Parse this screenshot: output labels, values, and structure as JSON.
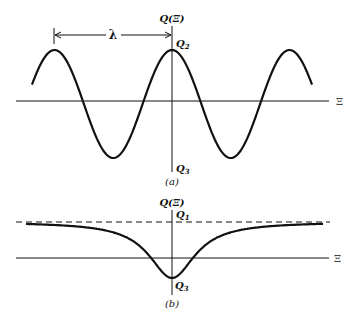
{
  "panel_a": {
    "caption": "(a)",
    "y_axis_label": "Q(Ξ)",
    "x_axis_label": "Ξ",
    "wavelength_label": "λ",
    "max_label": "Q",
    "max_sub": "2",
    "min_label": "Q",
    "min_sub": "3",
    "curve": "sinusoid, peaks at -λ, 0, +λ; amplitude between Q3 and Q2"
  },
  "panel_b": {
    "caption": "(b)",
    "y_axis_label": "Q(Ξ)",
    "x_axis_label": "Ξ",
    "asymptote_label": "Q",
    "asymptote_sub": "1",
    "min_label": "Q",
    "min_sub": "3",
    "curve": "single dip to Q3 at Ξ=0, approaching asymptote Q1 (dashed) as |Ξ| grows"
  },
  "colors": {
    "ink": "#111111",
    "background": "#ffffff"
  }
}
